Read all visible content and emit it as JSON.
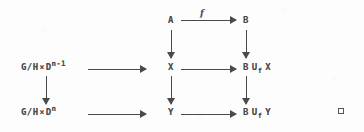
{
  "diagram": {
    "type": "commutative-diagram",
    "nodes": {
      "top_middle": "A",
      "top_right": "B",
      "mid_left_prefix": "G/H",
      "mid_left_times": "×",
      "mid_left_base": "D",
      "mid_left_exponent": "n-1",
      "mid_middle": "X",
      "mid_right_base": "B",
      "mid_right_union": "U",
      "mid_right_subscript": "f",
      "mid_right_operand": "X",
      "bot_left_prefix": "G/H",
      "bot_left_times": "×",
      "bot_left_base": "D",
      "bot_left_exponent": "n",
      "bot_middle": "Y",
      "bot_right_base": "B",
      "bot_right_union": "U",
      "bot_right_subscript": "f",
      "bot_right_operand": "Y"
    },
    "labels": {
      "top_arrow": "f"
    },
    "end_mark": "□",
    "colors": {
      "ink": "#4a4a4a",
      "background": "#fdfdfd"
    }
  }
}
